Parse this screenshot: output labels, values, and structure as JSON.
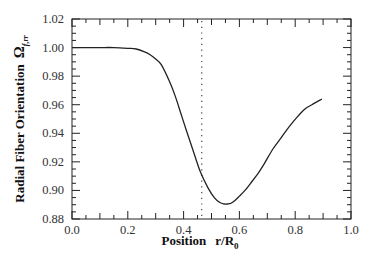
{
  "chart_data": {
    "type": "line",
    "title": "",
    "xlabel": "Position r/R0",
    "xlabel_main": "Position",
    "xlabel_var": "r/R",
    "xlabel_sub": "0",
    "ylabel": "Radial Fiber Orientation Ω f,rr",
    "ylabel_main": "Radial Fiber Orientation",
    "ylabel_symbol": "Ω",
    "ylabel_sub": "f,rr",
    "xlim": [
      0.0,
      1.0
    ],
    "ylim": [
      0.88,
      1.02
    ],
    "xticks": [
      "0.0",
      "0.2",
      "0.4",
      "0.6",
      "0.8",
      "1.0"
    ],
    "yticks": [
      "0.88",
      "0.90",
      "0.92",
      "0.94",
      "0.96",
      "0.98",
      "1.00",
      "1.02"
    ],
    "grid": false,
    "legend": null,
    "series": [
      {
        "name": "Radial fiber orientation",
        "style": "solid",
        "color": "#222222",
        "x": [
          0.0,
          0.05,
          0.1,
          0.15,
          0.2,
          0.23,
          0.26,
          0.28,
          0.3,
          0.32,
          0.35,
          0.37,
          0.39,
          0.41,
          0.434,
          0.46,
          0.487,
          0.51,
          0.53,
          0.545,
          0.558,
          0.57,
          0.584,
          0.6,
          0.62,
          0.64,
          0.667,
          0.69,
          0.72,
          0.75,
          0.78,
          0.81,
          0.835,
          0.86,
          0.896
        ],
        "y": [
          1.0,
          1.0,
          1.0,
          1.0,
          0.9995,
          0.999,
          0.997,
          0.995,
          0.992,
          0.988,
          0.976,
          0.966,
          0.954,
          0.942,
          0.928,
          0.913,
          0.902,
          0.895,
          0.8915,
          0.8905,
          0.8905,
          0.891,
          0.893,
          0.896,
          0.9,
          0.905,
          0.912,
          0.919,
          0.929,
          0.937,
          0.945,
          0.952,
          0.957,
          0.96,
          0.964
        ]
      }
    ],
    "annotations": [
      {
        "type": "vertical_dotted_line",
        "x": 0.465,
        "color": "#444444"
      }
    ]
  }
}
